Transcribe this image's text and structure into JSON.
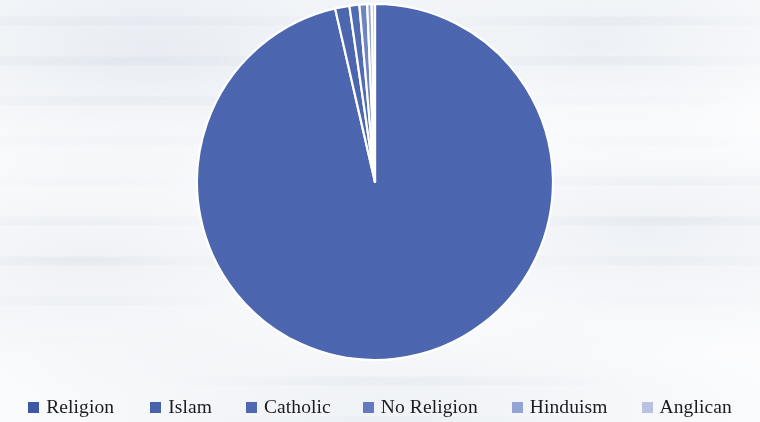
{
  "chart_data": {
    "type": "pie",
    "title": "",
    "legend_position": "bottom",
    "categories": [
      "Religion",
      "Islam",
      "Catholic",
      "No Religion",
      "Hinduism",
      "Anglican"
    ],
    "values": [
      96.4,
      1.3,
      0.9,
      0.7,
      0.4,
      0.3
    ],
    "colors": [
      "#4a63ae",
      "#4a63ae",
      "#4f68b0",
      "#6d82c0",
      "#92a5d2",
      "#b9c5e2"
    ],
    "slice_labels_shown": false,
    "start_angle_deg": 0,
    "direction": "clockwise",
    "units": "percent",
    "slices": [
      {
        "label": "Religion",
        "value": 96.4,
        "color": "#4a63ae"
      },
      {
        "label": "Islam",
        "value": 1.3,
        "color": "#4a63ae"
      },
      {
        "label": "Catholic",
        "value": 0.9,
        "color": "#4f68b0"
      },
      {
        "label": "No Religion",
        "value": 0.7,
        "color": "#6d82c0"
      },
      {
        "label": "Hinduism",
        "value": 0.4,
        "color": "#92a5d2"
      },
      {
        "label": "Anglican",
        "value": 0.3,
        "color": "#b9c5e2"
      }
    ]
  },
  "legend": {
    "items": [
      {
        "label": "Religion",
        "color": "#3f58a6",
        "gap_after": 36
      },
      {
        "label": "Islam",
        "color": "#4763ac",
        "gap_after": 34
      },
      {
        "label": "Catholic",
        "color": "#4e69b2",
        "gap_after": 32
      },
      {
        "label": "No Religion",
        "color": "#6479bf",
        "gap_after": 34
      },
      {
        "label": "Hinduism",
        "color": "#93a6d3",
        "gap_after": 34
      },
      {
        "label": "Anglican",
        "color": "#b7c3e0",
        "gap_after": 0
      }
    ]
  },
  "geometry": {
    "center_x": 375,
    "center_y": 182,
    "radius": 178
  }
}
